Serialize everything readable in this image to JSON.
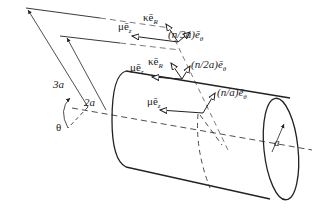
{
  "diagram": {
    "type": "vortex rings around cylinder",
    "labels": {
      "mu_ez_top": "μē",
      "mu_ez_top_sub": "z",
      "kappa_er_top": "κē",
      "kappa_er_top_sub": "R",
      "n3a": "(n/3a)ē",
      "n3a_sub": "θ",
      "mu_ez_mid": "μē",
      "mu_ez_mid_sub": "z",
      "kappa_er_mid": "κē",
      "kappa_er_mid_sub": "R",
      "n2a": "(n/2a)ē",
      "n2a_sub": "θ",
      "mu_ez_low": "μē",
      "mu_ez_low_sub": "z",
      "na": "(n/a)ē",
      "na_sub": "θ",
      "r3a": "3a",
      "r2a": "2a",
      "theta": "θ",
      "radius_a": "a"
    },
    "colors": {
      "line": "#222222",
      "background": "#ffffff"
    }
  }
}
